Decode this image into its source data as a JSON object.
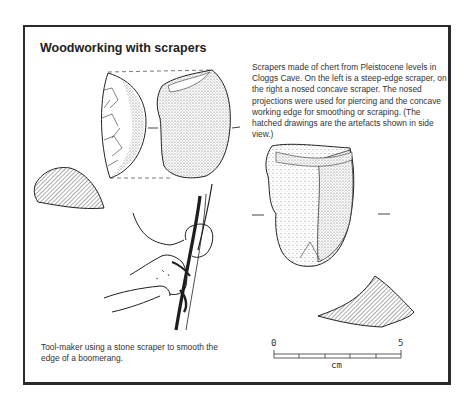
{
  "figure": {
    "title": "Woodworking with scrapers",
    "caption_artefacts": "Scrapers made of chert from Pleistocene levels in Cloggs Cave. On the left is a steep-edge scraper, on the right a nosed concave scraper. The nosed projections were used for piercing and the concave working edge for smoothing or scraping. (The hatched drawings are the artefacts shown in side view.)",
    "caption_toolmaker": "Tool-maker using a stone scraper to smooth the edge of a boomerang.",
    "scale_bar": {
      "start_label": "0",
      "end_label": "5",
      "unit": "cm",
      "divisions": 5
    },
    "illustrations": [
      "steep-edge-scraper-front",
      "steep-edge-scraper-face",
      "steep-edge-scraper-side-view-hatched",
      "nosed-concave-scraper",
      "nosed-concave-scraper-side-view-hatched",
      "toolmaker-hands-boomerang"
    ]
  }
}
